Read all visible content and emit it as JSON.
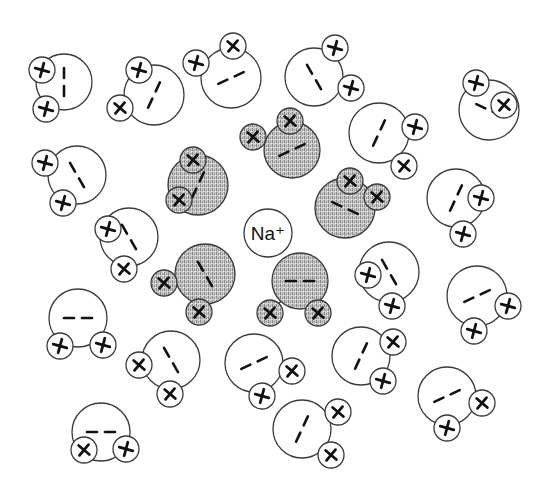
{
  "diagram": {
    "type": "hydration-shell",
    "description_label": "Na+ ion surrounded by water molecules",
    "ion": {
      "label": "Na⁺",
      "x": 268,
      "y": 233,
      "r": 24
    },
    "colors": {
      "stroke": "#3a3a3a",
      "fill_plain": "#ffffff",
      "fill_shaded": "#b9b9b9",
      "mark": "#111111"
    },
    "charge_symbols": {
      "hydrogen": "+",
      "oxygen": "−"
    },
    "molecules": [
      {
        "id": 1,
        "shaded": false,
        "o": [
          64,
          82,
          28
        ],
        "h": [
          [
            42,
            70
          ],
          [
            46,
            109
          ]
        ],
        "marks": "vertical"
      },
      {
        "id": 2,
        "shaded": false,
        "o": [
          154,
          95,
          30
        ],
        "h": [
          [
            139,
            70
          ],
          [
            120,
            108
          ]
        ],
        "marks": "diag-up"
      },
      {
        "id": 3,
        "shaded": false,
        "o": [
          231,
          78,
          30
        ],
        "h": [
          [
            196,
            63
          ],
          [
            233,
            46
          ]
        ],
        "marks": "diag-low"
      },
      {
        "id": 4,
        "shaded": false,
        "o": [
          314,
          77,
          29
        ],
        "h": [
          [
            335,
            48
          ],
          [
            351,
            88
          ]
        ],
        "marks": "diag-down"
      },
      {
        "id": 5,
        "shaded": false,
        "o": [
          489,
          110,
          30
        ],
        "h": [
          [
            476,
            83
          ],
          [
            504,
            105
          ]
        ],
        "marks": "diag-down-flat"
      },
      {
        "id": 6,
        "shaded": false,
        "o": [
          379,
          133,
          30
        ],
        "h": [
          [
            415,
            127
          ],
          [
            404,
            166
          ]
        ],
        "marks": "diag-up"
      },
      {
        "id": 7,
        "shaded": false,
        "o": [
          77,
          175,
          29
        ],
        "h": [
          [
            45,
            163
          ],
          [
            63,
            203
          ]
        ],
        "marks": "diag-down"
      },
      {
        "id": 8,
        "shaded": true,
        "o": [
          198,
          185,
          30
        ],
        "h": [
          [
            193,
            160
          ],
          [
            179,
            200
          ]
        ],
        "marks": "diag-up"
      },
      {
        "id": 9,
        "shaded": true,
        "o": [
          292,
          150,
          28
        ],
        "h": [
          [
            253,
            137
          ],
          [
            290,
            121
          ]
        ],
        "marks": "diag-low"
      },
      {
        "id": 10,
        "shaded": true,
        "o": [
          345,
          208,
          30
        ],
        "h": [
          [
            350,
            181
          ],
          [
            377,
            197
          ]
        ],
        "marks": "diag-down-flat"
      },
      {
        "id": 11,
        "shaded": false,
        "o": [
          129,
          237,
          29
        ],
        "h": [
          [
            108,
            229
          ],
          [
            124,
            269
          ]
        ],
        "marks": "diag-down"
      },
      {
        "id": 13,
        "shaded": true,
        "o": [
          205,
          274,
          30
        ],
        "h": [
          [
            164,
            283
          ],
          [
            199,
            312
          ]
        ],
        "marks": "diag-down"
      },
      {
        "id": 14,
        "shaded": true,
        "o": [
          300,
          281,
          28
        ],
        "h": [
          [
            270,
            313
          ],
          [
            318,
            313
          ]
        ],
        "marks": "horizontal"
      },
      {
        "id": 15,
        "shaded": false,
        "o": [
          456,
          198,
          29
        ],
        "h": [
          [
            481,
            198
          ],
          [
            463,
            234
          ]
        ],
        "marks": "diag-up"
      },
      {
        "id": 16,
        "shaded": false,
        "o": [
          389,
          272,
          30
        ],
        "h": [
          [
            368,
            275
          ],
          [
            392,
            306
          ]
        ],
        "marks": "diag-down"
      },
      {
        "id": 17,
        "shaded": false,
        "o": [
          477,
          296,
          30
        ],
        "h": [
          [
            508,
            306
          ],
          [
            474,
            331
          ]
        ],
        "marks": "diag-low"
      },
      {
        "id": 18,
        "shaded": false,
        "o": [
          78,
          318,
          29
        ],
        "h": [
          [
            60,
            346
          ],
          [
            103,
            345
          ]
        ],
        "marks": "horizontal"
      },
      {
        "id": 19,
        "shaded": false,
        "o": [
          171,
          360,
          29
        ],
        "h": [
          [
            139,
            365
          ],
          [
            170,
            394
          ]
        ],
        "marks": "diag-down"
      },
      {
        "id": 20,
        "shaded": false,
        "o": [
          254,
          363,
          29
        ],
        "h": [
          [
            292,
            371
          ],
          [
            262,
            396
          ]
        ],
        "marks": "diag-low"
      },
      {
        "id": 21,
        "shaded": false,
        "o": [
          361,
          356,
          29
        ],
        "h": [
          [
            393,
            342
          ],
          [
            383,
            381
          ]
        ],
        "marks": "diag-up"
      },
      {
        "id": 22,
        "shaded": false,
        "o": [
          447,
          396,
          29
        ],
        "h": [
          [
            482,
            403
          ],
          [
            447,
            428
          ]
        ],
        "marks": "diag-low"
      },
      {
        "id": 23,
        "shaded": false,
        "o": [
          302,
          429,
          29
        ],
        "h": [
          [
            338,
            412
          ],
          [
            331,
            455
          ]
        ],
        "marks": "diag-up"
      },
      {
        "id": 24,
        "shaded": false,
        "o": [
          101,
          432,
          29
        ],
        "h": [
          [
            84,
            450
          ],
          [
            126,
            449
          ]
        ],
        "marks": "horizontal"
      }
    ]
  }
}
